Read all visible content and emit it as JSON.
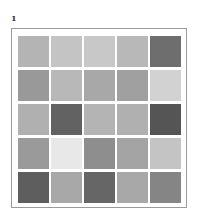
{
  "panel_label": "1",
  "grid": {
    "rows": 5,
    "cols": 5,
    "cells": [
      [
        "#b4b4b4",
        "#c4c4c4",
        "#c8c8c8",
        "#b8b8b8",
        "#6e6e6e"
      ],
      [
        "#999999",
        "#b8b8b8",
        "#a8a8a8",
        "#a0a0a0",
        "#d2d2d2"
      ],
      [
        "#b0b0b0",
        "#626262",
        "#b4b4b4",
        "#b0b0b0",
        "#555555"
      ],
      [
        "#9a9a9a",
        "#e8e8e8",
        "#8e8e8e",
        "#a4a4a4",
        "#c4c4c4"
      ],
      [
        "#5e5e5e",
        "#a8a8a8",
        "#666666",
        "#a8a8a8",
        "#858585"
      ]
    ]
  }
}
